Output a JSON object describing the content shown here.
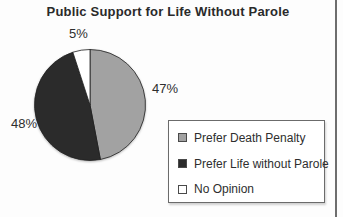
{
  "page": {
    "background": "#fdfdfd",
    "right_edge_line_color": "#6e6e6e"
  },
  "chart_data": {
    "type": "pie",
    "title": "Public Support for Life Without Parole",
    "total": 100,
    "start_angle_deg": 0,
    "direction": "clockwise",
    "outline_color": "#1f1f1f",
    "legend": {
      "position": "bottom-right",
      "border_color": "#6b6b6b",
      "background": "#ffffff"
    },
    "slices": [
      {
        "id": "death-penalty",
        "label": "Prefer Death Penalty",
        "value": 47,
        "pct_label": "47%",
        "color": "#a2a2a2"
      },
      {
        "id": "life-without-parole",
        "label": "Prefer Life without Parole",
        "value": 48,
        "pct_label": "48%",
        "color": "#2b2b2b"
      },
      {
        "id": "no-opinion",
        "label": "No Opinion",
        "value": 5,
        "pct_label": "5%",
        "color": "#ffffff"
      }
    ]
  }
}
